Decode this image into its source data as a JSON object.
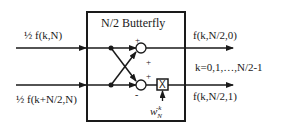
{
  "diagram": {
    "block_title": "N/2 Butterfly",
    "inputs": [
      {
        "label": "½ f(k,N)"
      },
      {
        "label": "½ f(k+N/2,N)"
      }
    ],
    "outputs": [
      {
        "label": "f(k,N/2,0)"
      },
      {
        "label": "f(k,N/2,1)"
      }
    ],
    "index_range": "k=0,1,…,N/2-1",
    "twiddle": {
      "base": "w",
      "sub": "N",
      "sup": "-k",
      "multiplier_symbol": "X"
    },
    "signs": {
      "top_adder_upper": "+",
      "top_adder_lower": "+",
      "bottom_adder_upper": "+",
      "bottom_adder_lower": "-"
    },
    "colors": {
      "stroke": "#1a1a1a",
      "background": "#ffffff"
    }
  }
}
